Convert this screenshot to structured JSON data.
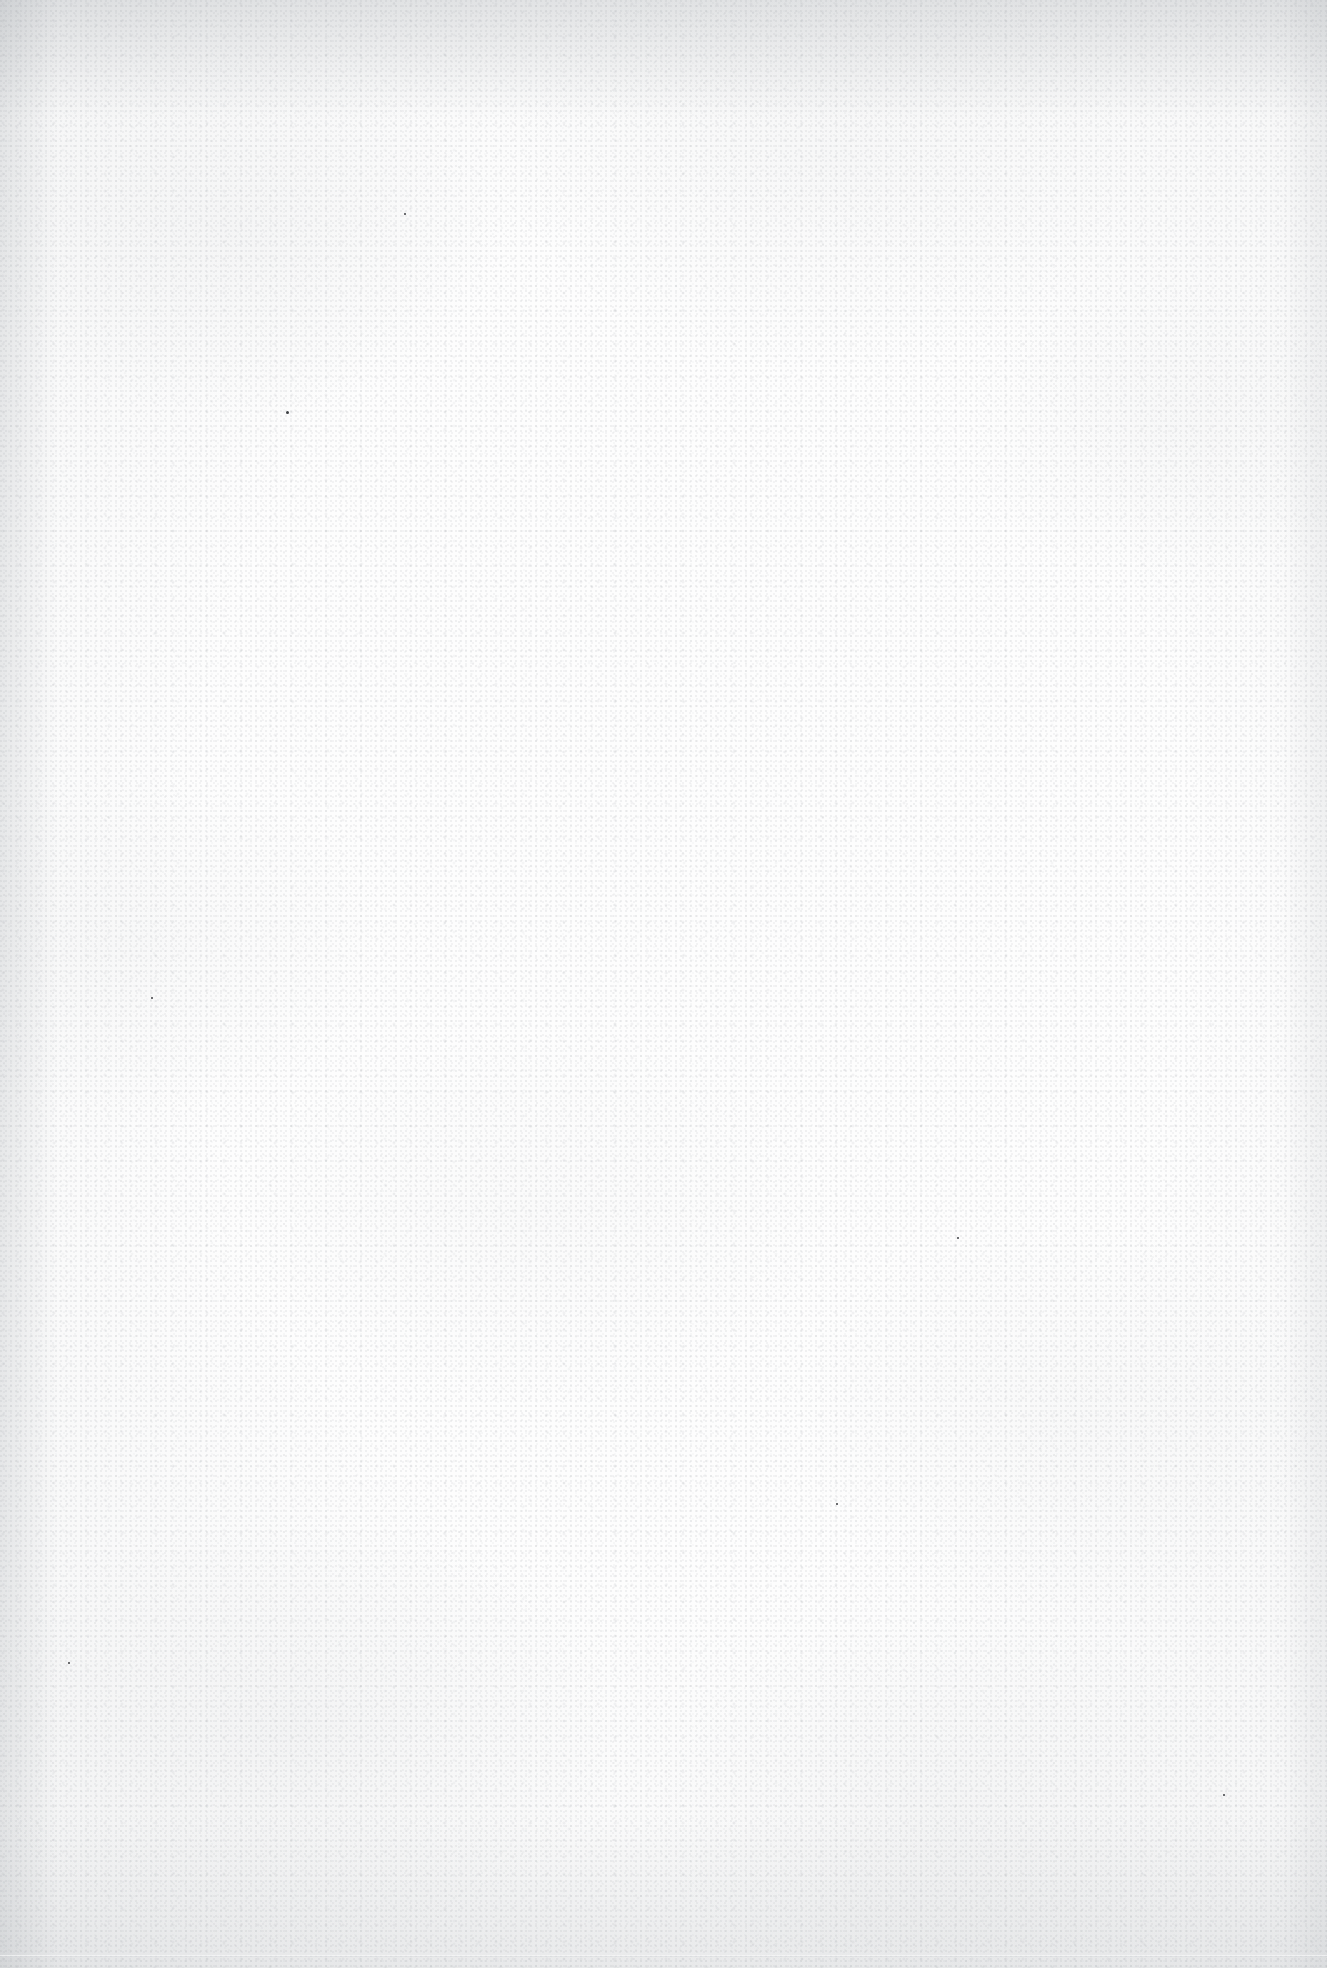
{
  "page": {
    "kind": "blank-scanned-page",
    "width": 1327,
    "height": 1968,
    "visible_text": "",
    "content_note": "",
    "paper_color": "#fdfdfd",
    "edge_shadow_color": "#f1f2f3",
    "grain_color": "#787d84",
    "speck_color": "#3c3e42"
  },
  "artifacts": {
    "specks": [
      {
        "x": 286,
        "y": 411,
        "size": 3
      },
      {
        "x": 836,
        "y": 1503,
        "size": 2
      },
      {
        "x": 1223,
        "y": 1794,
        "size": 2
      },
      {
        "x": 404,
        "y": 213,
        "size": 2
      },
      {
        "x": 957,
        "y": 1237,
        "size": 2
      },
      {
        "x": 151,
        "y": 997,
        "size": 2
      },
      {
        "x": 68,
        "y": 1662,
        "size": 2
      }
    ]
  }
}
